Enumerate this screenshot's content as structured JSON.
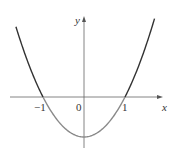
{
  "chart_data": {
    "type": "line",
    "title": "",
    "xlabel": "x",
    "ylabel": "y",
    "function": "y = x^2 - 1",
    "x_ticks": [
      "-1",
      "0",
      "1"
    ],
    "origin_label": "0",
    "xlim": [
      -2.0,
      1.85
    ],
    "ylim": [
      -1.25,
      2.0
    ],
    "series": [
      {
        "name": "y = x^2 - 1",
        "x": [
          -1.65,
          -1.5,
          -1.25,
          -1.0,
          -0.75,
          -0.5,
          -0.25,
          0.0,
          0.25,
          0.5,
          0.75,
          1.0,
          1.25,
          1.5,
          1.7
        ],
        "values": [
          1.72,
          1.25,
          0.56,
          0.0,
          -0.44,
          -0.75,
          -0.94,
          -1.0,
          -0.94,
          -0.75,
          -0.44,
          0.0,
          0.56,
          1.25,
          1.89
        ]
      }
    ],
    "roots": [
      -1,
      1
    ],
    "minimum": {
      "x": 0,
      "y": -1
    },
    "grid": false,
    "legend": "none"
  },
  "labels": {
    "x_axis": "x",
    "y_axis": "y",
    "tick_neg1": "−1",
    "tick_0": "0",
    "tick_1": "1"
  },
  "colors": {
    "axis": "#555555",
    "curve_above": "#333333",
    "curve_below": "#8a8a8a"
  }
}
